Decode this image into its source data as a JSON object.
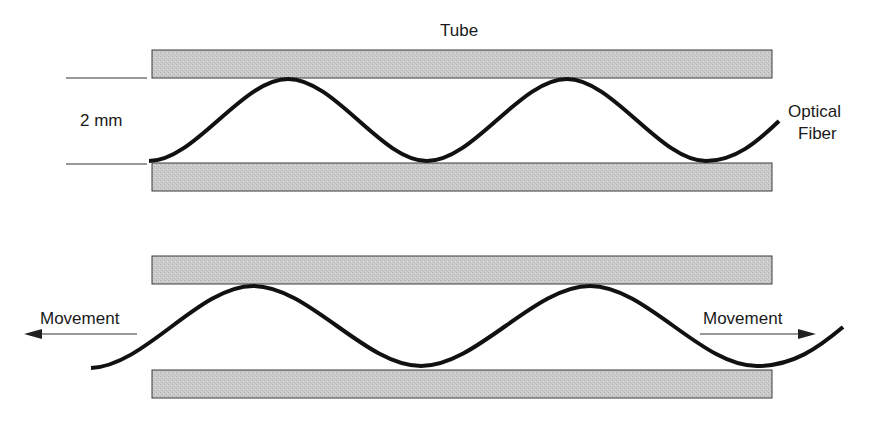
{
  "figure": {
    "colors": {
      "tube_fill": "#c9c9c9",
      "tube_stroke": "#3a3a3a",
      "fiber": "#111111",
      "line": "#333333",
      "text": "#1a1a1a",
      "background": "#ffffff"
    }
  },
  "top_panel": {
    "tube_label": "Tube",
    "gap_label": "2 mm",
    "fiber_label_line1": "Optical",
    "fiber_label_line2": "Fiber"
  },
  "bottom_panel": {
    "left_movement_label": "Movement",
    "right_movement_label": "Movement"
  }
}
